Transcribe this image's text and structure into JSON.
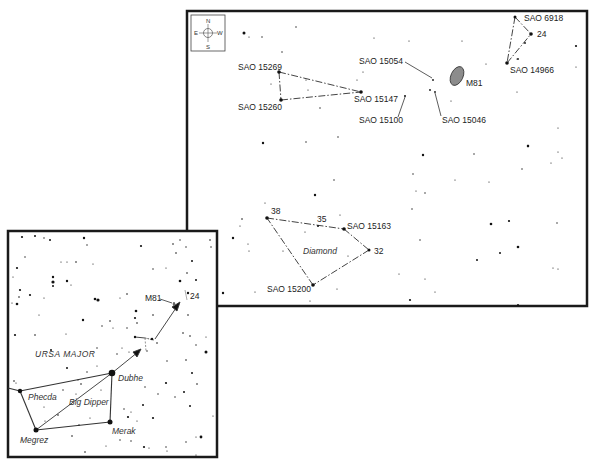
{
  "detail_chart": {
    "compass": {
      "north": "N",
      "south": "S",
      "east": "E",
      "west": "W"
    },
    "labels": {
      "sao15269": "SAO 15269",
      "sao15260": "SAO 15260",
      "sao15147": "SAO 15147",
      "sao15054": "SAO 15054",
      "sao15100": "SAO 15100",
      "sao15046": "SAO 15046",
      "m81": "M81",
      "sao6918": "SAO 6918",
      "star24": "24",
      "sao14966": "SAO 14966",
      "star38": "38",
      "star35": "35",
      "sao15163": "SAO 15163",
      "star32": "32",
      "sao15200": "SAO 15200",
      "diamond": "Diamond"
    }
  },
  "finder_chart": {
    "labels": {
      "constellation": "URSA MAJOR",
      "asterism": "Big Dipper",
      "dubhe": "Dubhe",
      "merak": "Merak",
      "phecda": "Phecda",
      "megrez": "Megrez",
      "m81": "M81",
      "star24": "24"
    }
  },
  "colors": {
    "ink": "#111111",
    "frame": "#1a1a1a",
    "galaxy_fill": "#8c8c8c",
    "background": "#ffffff"
  }
}
